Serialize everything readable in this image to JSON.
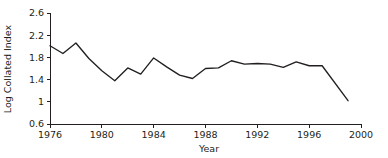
{
  "chart_data": {
    "type": "line",
    "title": "",
    "xlabel": "Year",
    "ylabel": "Log Collated Index",
    "xlim": [
      1976,
      2000
    ],
    "ylim": [
      0.6,
      2.6
    ],
    "xticks": [
      1976,
      1980,
      1984,
      1988,
      1992,
      1996,
      2000
    ],
    "xticklabels": [
      "1976",
      "1980",
      "1984",
      "1988",
      "1992",
      "1996",
      "2000"
    ],
    "yticks": [
      0.6,
      1,
      1.4,
      1.8,
      2.2,
      2.6
    ],
    "yticklabels": [
      "0.6",
      "1",
      "1.4",
      "1.8",
      "2.2",
      "2.6"
    ],
    "grid": false,
    "legend": null,
    "line_color": "#231f20",
    "background_color": "#ffffff",
    "series": [
      {
        "name": "Log Collated Index",
        "x": [
          1976,
          1977,
          1978,
          1979,
          1980,
          1981,
          1982,
          1983,
          1984,
          1985,
          1986,
          1987,
          1988,
          1989,
          1990,
          1991,
          1992,
          1993,
          1994,
          1995,
          1996,
          1997,
          1999
        ],
        "values": [
          2.01,
          1.87,
          2.06,
          1.78,
          1.56,
          1.38,
          1.61,
          1.5,
          1.79,
          1.63,
          1.48,
          1.42,
          1.6,
          1.61,
          1.74,
          1.68,
          1.69,
          1.68,
          1.62,
          1.72,
          1.65,
          1.65,
          1.02
        ]
      }
    ]
  },
  "axes": {
    "x_title": "Year",
    "y_title": "Log Collated Index"
  }
}
